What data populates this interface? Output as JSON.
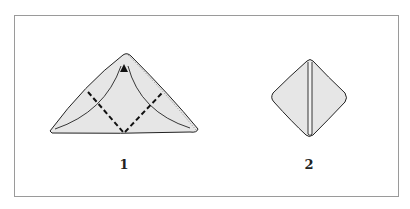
{
  "figure": {
    "panels": [
      {
        "id": "1",
        "label": "1",
        "shape": "folded-triangle-with-dashed-fold-lines"
      },
      {
        "id": "2",
        "label": "2",
        "shape": "folded-diamond"
      }
    ],
    "colors": {
      "fill": "#e6e6e6",
      "stroke": "#222222",
      "frame": "#9a9a9a"
    }
  }
}
